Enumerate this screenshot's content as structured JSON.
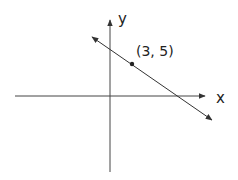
{
  "diagram": {
    "x_axis_label": "x",
    "y_axis_label": "y",
    "point_label": "(3, 5)",
    "line_color": "#333333",
    "background": "#ffffff"
  }
}
